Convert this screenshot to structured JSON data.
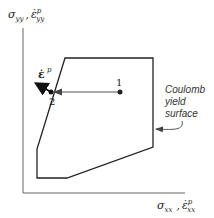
{
  "figure": {
    "type": "yield-surface-diagram",
    "y_axis_label": {
      "sigma": "σ",
      "sigma_sub": "yy",
      "sep": ",",
      "eps": "ε̇",
      "eps_sup": "p",
      "eps_sub": "yy"
    },
    "x_axis_label": {
      "sigma": "σ",
      "sigma_sub": "xx",
      "sep": ",",
      "eps": "ε̇",
      "eps_sup": "p",
      "eps_sub": "xx"
    },
    "surface_label_lines": [
      "Coulomb",
      "yield",
      "surface"
    ],
    "points": [
      {
        "label": "1",
        "x": 120,
        "y": 92
      },
      {
        "label": "2",
        "x": 50,
        "y": 92
      }
    ],
    "strain_rate_label": {
      "eps": "ε̇",
      "sup": "p"
    },
    "polygon": [
      [
        65,
        58
      ],
      [
        153,
        58
      ],
      [
        153,
        147
      ],
      [
        67,
        178
      ],
      [
        37,
        178
      ],
      [
        37,
        149
      ]
    ],
    "colors": {
      "line": "#222222",
      "axis": "#555555",
      "arrow": "#444444"
    }
  }
}
